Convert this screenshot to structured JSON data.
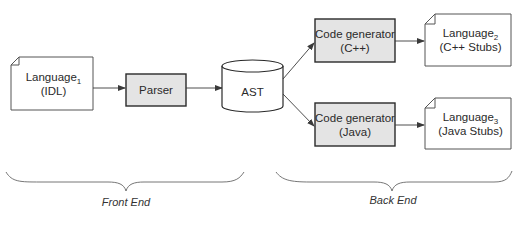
{
  "diagram": {
    "type": "compiler-pipeline",
    "colors": {
      "stroke": "#3a3a3a",
      "process_fill": "#e4e4e4",
      "document_fill": "#ffffff",
      "background": "#ffffff"
    },
    "nodes": {
      "input_doc": {
        "name": "Language",
        "subscript": "1",
        "detail": "(IDL)",
        "shape": "document"
      },
      "parser": {
        "label": "Parser",
        "shape": "process"
      },
      "ast": {
        "label": "AST",
        "shape": "cylinder"
      },
      "codegen_cpp": {
        "line1": "Code generator",
        "line2": "(C++)",
        "shape": "process"
      },
      "codegen_java": {
        "line1": "Code generator",
        "line2": "(Java)",
        "shape": "process"
      },
      "output_cpp": {
        "name": "Language",
        "subscript": "2",
        "detail": "(C++ Stubs)",
        "shape": "document"
      },
      "output_java": {
        "name": "Language",
        "subscript": "3",
        "detail": "(Java Stubs)",
        "shape": "document"
      }
    },
    "edges": [
      {
        "from": "input_doc",
        "to": "parser"
      },
      {
        "from": "parser",
        "to": "ast"
      },
      {
        "from": "ast",
        "to": "codegen_cpp"
      },
      {
        "from": "ast",
        "to": "codegen_java"
      },
      {
        "from": "codegen_cpp",
        "to": "output_cpp"
      },
      {
        "from": "codegen_java",
        "to": "output_java"
      }
    ],
    "sections": {
      "front_end": {
        "label": "Front End"
      },
      "back_end": {
        "label": "Back End"
      }
    }
  }
}
